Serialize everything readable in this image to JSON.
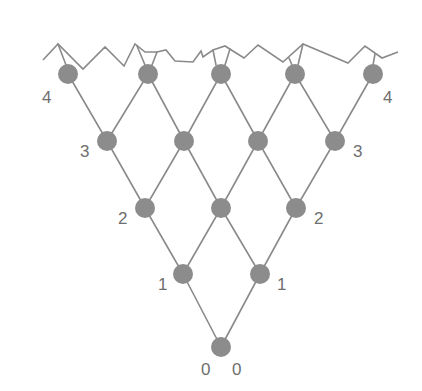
{
  "diagram": {
    "colors": {
      "line": "#8a8a8a",
      "node": "#8c8c8c",
      "label": "#6e6e6e",
      "background": "#ffffff"
    },
    "node_radius": 10,
    "nodes": [
      {
        "id": "r0n0",
        "row": 0,
        "x": 221,
        "y": 347
      },
      {
        "id": "r1n0",
        "row": 1,
        "x": 183,
        "y": 274
      },
      {
        "id": "r1n1",
        "row": 1,
        "x": 260,
        "y": 274
      },
      {
        "id": "r2n0",
        "row": 2,
        "x": 145,
        "y": 208
      },
      {
        "id": "r2n1",
        "row": 2,
        "x": 221,
        "y": 208
      },
      {
        "id": "r2n2",
        "row": 2,
        "x": 296,
        "y": 208
      },
      {
        "id": "r3n0",
        "row": 3,
        "x": 107,
        "y": 141
      },
      {
        "id": "r3n1",
        "row": 3,
        "x": 184,
        "y": 141
      },
      {
        "id": "r3n2",
        "row": 3,
        "x": 258,
        "y": 141
      },
      {
        "id": "r3n3",
        "row": 3,
        "x": 335,
        "y": 141
      },
      {
        "id": "r4n0",
        "row": 4,
        "x": 68,
        "y": 74
      },
      {
        "id": "r4n1",
        "row": 4,
        "x": 148,
        "y": 74
      },
      {
        "id": "r4n2",
        "row": 4,
        "x": 221,
        "y": 74
      },
      {
        "id": "r4n3",
        "row": 4,
        "x": 295,
        "y": 74
      },
      {
        "id": "r4n4",
        "row": 4,
        "x": 373,
        "y": 74
      }
    ],
    "labels": [
      {
        "text": "0",
        "x": 201,
        "y": 375
      },
      {
        "text": "0",
        "x": 232,
        "y": 375
      },
      {
        "text": "1",
        "x": 158,
        "y": 290
      },
      {
        "text": "1",
        "x": 277,
        "y": 290
      },
      {
        "text": "2",
        "x": 118,
        "y": 224
      },
      {
        "text": "2",
        "x": 314,
        "y": 224
      },
      {
        "text": "3",
        "x": 80,
        "y": 157
      },
      {
        "text": "3",
        "x": 353,
        "y": 157
      },
      {
        "text": "4",
        "x": 42,
        "y": 103
      },
      {
        "text": "4",
        "x": 383,
        "y": 103
      }
    ],
    "surface_path": "M43,60 L58,44 L83,69 L105,47 L124,66 L135,44 L145,52 L157,52 L166,50 L175,61 L193,62 L201,51 L203,57 L213,50 L225,46 L244,58 L258,45 L283,62 L303,44 L348,63 L365,46 L382,58 L398,52",
    "stubs": [
      {
        "x1": 58,
        "y1": 44,
        "x2": 66,
        "y2": 65
      },
      {
        "x1": 137,
        "y1": 46,
        "x2": 145,
        "y2": 65
      },
      {
        "x1": 157,
        "y1": 52,
        "x2": 152,
        "y2": 65
      },
      {
        "x1": 213,
        "y1": 50,
        "x2": 216,
        "y2": 65
      },
      {
        "x1": 230,
        "y1": 49,
        "x2": 225,
        "y2": 65
      },
      {
        "x1": 289,
        "y1": 58,
        "x2": 292,
        "y2": 65
      },
      {
        "x1": 303,
        "y1": 44,
        "x2": 298,
        "y2": 65
      },
      {
        "x1": 375,
        "y1": 54,
        "x2": 373,
        "y2": 65
      }
    ]
  }
}
